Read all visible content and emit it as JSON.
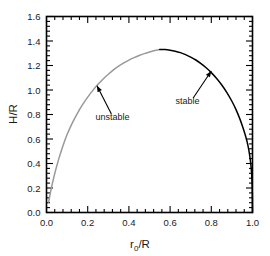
{
  "chart_data": {
    "type": "line",
    "title": "",
    "subtitle": "",
    "xlabel": "r_0/R",
    "xlabel_base": "r",
    "xlabel_sub": "0",
    "xlabel_rest": "/R",
    "ylabel": "H/R",
    "xlim": [
      0.0,
      1.0
    ],
    "ylim": [
      0.0,
      1.6
    ],
    "xticks": [
      "0.0",
      "0.2",
      "0.4",
      "0.6",
      "0.8",
      "1.0"
    ],
    "xtick_values": [
      0.0,
      0.2,
      0.4,
      0.6,
      0.8,
      1.0
    ],
    "yticks": [
      "0.0",
      "0.2",
      "0.4",
      "0.6",
      "0.8",
      "1.0",
      "1.2",
      "1.4",
      "1.6"
    ],
    "ytick_values": [
      0.0,
      0.2,
      0.4,
      0.6,
      0.8,
      1.0,
      1.2,
      1.4,
      1.6
    ],
    "minor_ticks_per_major": 4,
    "grid": false,
    "legend": "none",
    "tick_direction": "in",
    "frame": "box",
    "peak": {
      "x": 0.55,
      "y": 1.33
    },
    "series": [
      {
        "name": "unstable",
        "color": "#999999",
        "x": [
          0.01,
          0.02,
          0.03,
          0.045,
          0.06,
          0.08,
          0.1,
          0.125,
          0.15,
          0.175,
          0.2,
          0.225,
          0.25,
          0.275,
          0.3,
          0.325,
          0.35,
          0.375,
          0.4,
          0.425,
          0.45,
          0.475,
          0.5,
          0.525,
          0.55
        ],
        "y": [
          0.085,
          0.17,
          0.248,
          0.35,
          0.44,
          0.545,
          0.636,
          0.73,
          0.81,
          0.88,
          0.942,
          0.997,
          1.046,
          1.09,
          1.129,
          1.164,
          1.194,
          1.221,
          1.244,
          1.264,
          1.282,
          1.297,
          1.31,
          1.322,
          1.33
        ]
      },
      {
        "name": "stable",
        "color": "#000000",
        "x": [
          0.55,
          0.575,
          0.6,
          0.625,
          0.65,
          0.675,
          0.7,
          0.725,
          0.75,
          0.775,
          0.8,
          0.825,
          0.85,
          0.875,
          0.9,
          0.92,
          0.94,
          0.955,
          0.968,
          0.978,
          0.986,
          0.992,
          0.996,
          0.999,
          1.0
        ],
        "y": [
          1.33,
          1.33,
          1.325,
          1.317,
          1.305,
          1.289,
          1.269,
          1.245,
          1.216,
          1.182,
          1.142,
          1.096,
          1.043,
          0.981,
          0.908,
          0.84,
          0.758,
          0.685,
          0.614,
          0.546,
          0.47,
          0.39,
          0.31,
          0.17,
          0.0
        ]
      }
    ],
    "annotations": [
      {
        "name": "unstable",
        "label": "unstable",
        "label_x": 0.32,
        "label_y": 0.755,
        "arrow_tip_x": 0.245,
        "arrow_tip_y": 1.035,
        "arrow_tail_x": 0.315,
        "arrow_tail_y": 0.805
      },
      {
        "name": "stable",
        "label": "stable",
        "label_x": 0.685,
        "label_y": 0.885,
        "arrow_tip_x": 0.8,
        "arrow_tip_y": 1.155,
        "arrow_tail_x": 0.712,
        "arrow_tail_y": 0.935
      }
    ]
  }
}
